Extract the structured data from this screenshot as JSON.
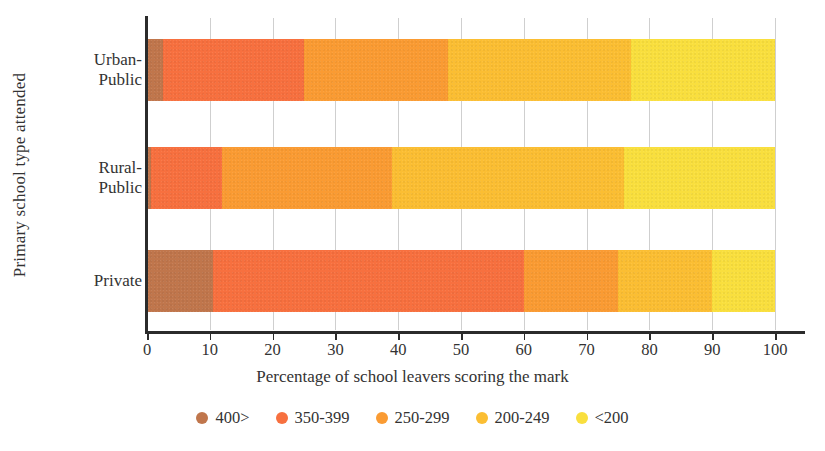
{
  "chart_data": {
    "type": "bar",
    "orientation": "horizontal",
    "stacked": true,
    "stack_mode": "percent",
    "title": "",
    "xlabel": "Percentage of school leavers scoring the mark",
    "ylabel": "Primary school type attended",
    "xlim": [
      0,
      100
    ],
    "xticks": [
      0,
      10,
      20,
      30,
      40,
      50,
      60,
      70,
      80,
      90,
      100
    ],
    "xtick_labels": [
      "0",
      "10",
      "20",
      "30",
      "40",
      "50",
      "60",
      "70",
      "80",
      "90",
      "100"
    ],
    "grid": "vertical",
    "legend_position": "bottom",
    "categories": [
      "Urban-Public",
      "Rural-Public",
      "Private"
    ],
    "category_lines": [
      [
        "Urban-",
        "Public"
      ],
      [
        "Rural-",
        "Public"
      ],
      [
        "Private"
      ]
    ],
    "series": [
      {
        "name": "400>",
        "color": "#C0764C",
        "values": [
          2.5,
          0.6,
          10.5
        ]
      },
      {
        "name": "350-399",
        "color": "#F7703F",
        "values": [
          22.5,
          11.4,
          49.5
        ]
      },
      {
        "name": "250-299",
        "color": "#FA9B33",
        "values": [
          23.0,
          27.0,
          15.0
        ]
      },
      {
        "name": "200-249",
        "color": "#FBBE33",
        "values": [
          29.0,
          37.0,
          15.0
        ]
      },
      {
        "name": "<200",
        "color": "#F9DF3E",
        "values": [
          23.0,
          24.0,
          10.0
        ]
      }
    ],
    "legend": [
      {
        "label": "400>",
        "color": "#C0764C"
      },
      {
        "label": "350-399",
        "color": "#F7703F"
      },
      {
        "label": "250-299",
        "color": "#FA9B33"
      },
      {
        "label": "200-249",
        "color": "#FBBE33"
      },
      {
        "label": "<200",
        "color": "#F9DF3E"
      }
    ],
    "axis_color": "#2b2b2b",
    "grid_color": "#cfcfcf"
  }
}
